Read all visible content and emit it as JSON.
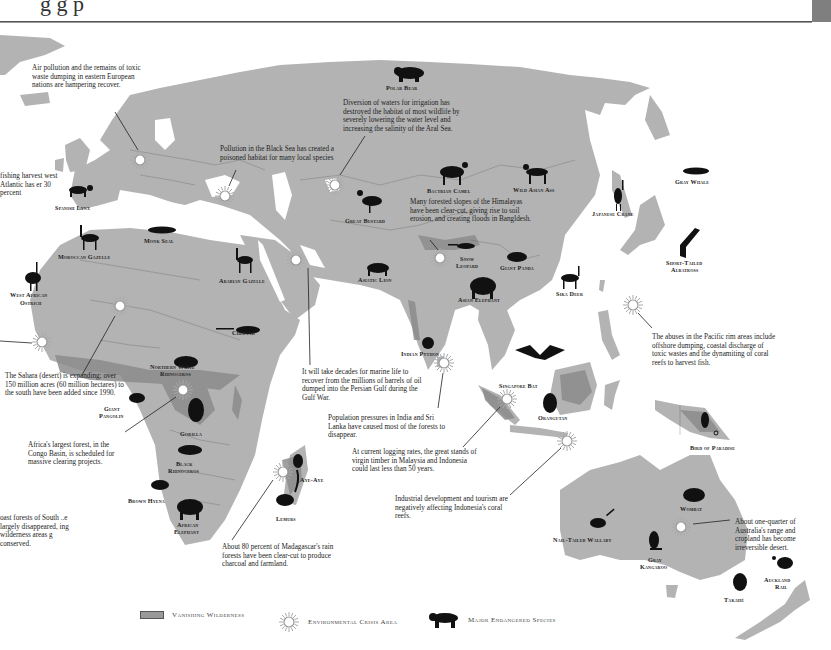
{
  "header": {
    "title_fragment": "g                              g   p"
  },
  "map": {
    "land_color": "#b3b3b3",
    "wilderness_color": "#8c8c8c",
    "border_color": "#555555",
    "species_color": "#111111"
  },
  "notes": {
    "east_europe": "Air pollution and the remains of toxic waste dumping in eastern European nations are hampering recover.",
    "aral_sea": "Diversion of waters for irrigation has destroyed the habitat of most wildlife by severely lowering the water level and increasing the salinity of the Aral Sea.",
    "black_sea": "Pollution in the Black Sea has created a poisoned habitat for many local species",
    "atlantic_fishing": "fishing harvest west Atlantic has er 30 percent",
    "himalayas": "Many forested slopes of the Himalayas have been clear-cut, giving rise to soil erosion, and creating floods in Bangldesh.",
    "sahara": "The Sahara (desert) is expanding; over 150 million acres (60 million hectares) to the south have been added since 1990.",
    "persian_gulf": "It will take decades for marine life to recover from the millions of barrels of oil dumped into the Persian Gulf during the Gulf War.",
    "congo": "Africa's largest forest, in the Congo Basin, is scheduled for massive clearing projects.",
    "india_srilanka": "Population pressures in India and Sri Lanka have caused most of the forests to disappear.",
    "malaysia": "At current logging rates, the great stands of virgin timber in Malaysia and Indonesia could last less than 50 years.",
    "indonesia_reefs": "Industrial development and tourism are negatively affecting Indonesia's coral reefs.",
    "pacific_rim": "The abuses in the Pacific rim areas include offshore dumping, coastal discharge of toxic wastes and the dynamiting of coral reefs to harvest fish.",
    "madagascar": "About 80 percent of Madagascar's rain forests have been clear-cut to produce charcoal and farmland.",
    "australia": "About one-quarter of Australia's range and cropland has become irreversible desert.",
    "south_america": "oast forests of South ..e largely disappeared, ing wilderness areas g conserved."
  },
  "species": {
    "polar_bear": "Polar Bear",
    "spanish_lynx": "Spanish Lynx",
    "moroccan_gazelle": "Moroccan Gazelle",
    "monk_seal": "Monk Seal",
    "west_african_ostrich_1": "West African",
    "west_african_ostrich_2": "Ostrich",
    "arabian_gazelle": "Arabian Gazelle",
    "great_bustard": "Great Bustard",
    "bactrian_camel": "Bactrian Camel",
    "wild_asian_ass": "Wild Asian Ass",
    "japanese_crane": "Japanese Crane",
    "gray_whale": "Gray Whale",
    "short_tailed_albatross_1": "Short-Tailed",
    "short_tailed_albatross_2": "Albatross",
    "asiatic_lion": "Asiatic Lion",
    "snow_leopard_1": "Snow",
    "snow_leopard_2": "Leopard",
    "giant_panda": "Giant Panda",
    "asian_elephant": "Asian Elephant",
    "sika_deer": "Sika Deer",
    "cheetah": "Cheetah",
    "indian_python": "Indian Python",
    "northern_white_rhino_1": "Northern White",
    "northern_white_rhino_2": "Rhinoceros",
    "giant_pangolin_1": "Giant",
    "giant_pangolin_2": "Pangolin",
    "gorilla": "Gorilla",
    "singapore_bat": "Singapore Bat",
    "orangutan": "Orangutan",
    "black_rhino_1": "Black",
    "black_rhino_2": "Rhinoceros",
    "bird_of_paradise": "Bird of Paradise",
    "aye_aye": "Aye-Aye",
    "lemurs": "Lemurs",
    "brown_hyena": "Brown Hyena",
    "african_elephant_1": "African",
    "african_elephant_2": "Elephant",
    "wombat": "Wombat",
    "nail_tailed_wallaby": "Nail-Tailed Wallaby",
    "gray_kangaroo_1": "Gray",
    "gray_kangaroo_2": "Kangaroo",
    "auckland_rail_1": "Auckland",
    "auckland_rail_2": "Rail",
    "takahe": "Takahé"
  },
  "legend": {
    "vanishing_wilderness": "Vanishing Wilderness",
    "environmental_crisis": "Environmental Crisis Area",
    "endangered_species": "Major Endangered Species"
  }
}
